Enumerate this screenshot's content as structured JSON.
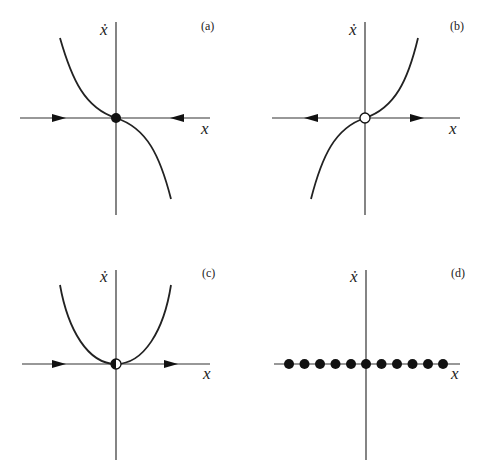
{
  "figure": {
    "panels": [
      {
        "id": "a",
        "label": "(a)",
        "y_axis_label": "ẋ",
        "x_axis_label": "x",
        "curve": "ẋ = -x³ (decreasing cubic through origin)",
        "fixed_point": {
          "x": 0,
          "type": "stable",
          "marker": "filled"
        },
        "flow_arrows": [
          "right (left side)",
          "left (right side)"
        ]
      },
      {
        "id": "b",
        "label": "(b)",
        "y_axis_label": "ẋ",
        "x_axis_label": "x",
        "curve": "ẋ = x³ (increasing cubic through origin)",
        "fixed_point": {
          "x": 0,
          "type": "unstable",
          "marker": "open"
        },
        "flow_arrows": [
          "left (left side)",
          "right (right side)"
        ]
      },
      {
        "id": "c",
        "label": "(c)",
        "y_axis_label": "ẋ",
        "x_axis_label": "x",
        "curve": "ẋ = x² (parabola touching origin)",
        "fixed_point": {
          "x": 0,
          "type": "half-stable",
          "marker": "half-filled"
        },
        "flow_arrows": [
          "right (left side)",
          "right (right side)"
        ]
      },
      {
        "id": "d",
        "label": "(d)",
        "y_axis_label": "ẋ",
        "x_axis_label": "x",
        "curve": "ẋ = 0 (line of fixed points)",
        "fixed_points_count": 11,
        "marker": "filled"
      }
    ]
  }
}
